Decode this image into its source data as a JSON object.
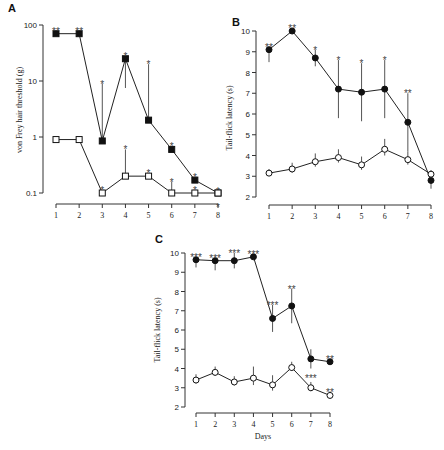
{
  "chart_data": [
    {
      "panel": "A",
      "type": "line",
      "title": "",
      "xlabel": "",
      "ylabel": "von Frey hair threshold (g)",
      "yscale": "log",
      "ylim": [
        0.1,
        100
      ],
      "yticks": [
        "0.1",
        "1",
        "10",
        "100"
      ],
      "x": [
        1,
        2,
        3,
        4,
        5,
        6,
        7,
        8
      ],
      "series": [
        {
          "name": "filled squares",
          "marker": "square-filled",
          "values": [
            70,
            70,
            0.85,
            25,
            2,
            0.6,
            0.17,
            0.1
          ],
          "error_up": [
            null,
            null,
            9,
            null,
            20,
            null,
            null,
            null
          ],
          "error_down": [
            null,
            null,
            null,
            7.5,
            null,
            null,
            null,
            null
          ],
          "sig": [
            "**",
            "**",
            "*",
            "*",
            "*",
            "*",
            "*",
            "*"
          ]
        },
        {
          "name": "open squares",
          "marker": "square-open",
          "values": [
            0.9,
            0.9,
            0.1,
            0.2,
            0.2,
            0.1,
            0.1,
            0.1
          ],
          "error_up": [
            null,
            null,
            null,
            0.6,
            null,
            0.16,
            null,
            null
          ],
          "sig": [
            "",
            "",
            "*",
            "*",
            "*",
            "*",
            "*",
            "*"
          ]
        }
      ],
      "grid": false
    },
    {
      "panel": "B",
      "type": "line",
      "title": "",
      "xlabel": "",
      "ylabel": "Tail-flick latency (s)",
      "ylim": [
        2,
        10
      ],
      "yticks": [
        "2",
        "3",
        "4",
        "5",
        "6",
        "7",
        "8",
        "9",
        "10"
      ],
      "x": [
        1,
        2,
        3,
        4,
        5,
        6,
        7,
        8
      ],
      "series": [
        {
          "name": "filled circles",
          "marker": "circle-filled",
          "values": [
            9.1,
            10.0,
            8.7,
            7.2,
            7.05,
            7.2,
            5.6,
            2.8
          ],
          "err": [
            0.6,
            0.0,
            0.4,
            1.4,
            1.4,
            1.4,
            1.4,
            0.4
          ],
          "sig": [
            "**",
            "**",
            "*",
            "*",
            "*",
            "*",
            "**",
            ""
          ]
        },
        {
          "name": "open circles",
          "marker": "circle-open",
          "values": [
            3.15,
            3.35,
            3.7,
            3.9,
            3.55,
            4.3,
            3.8,
            3.1
          ],
          "err": [
            0.2,
            0.3,
            0.4,
            0.4,
            0.4,
            0.5,
            0.4,
            0.2
          ],
          "sig": [
            "",
            "",
            "",
            "",
            "",
            "",
            "",
            ""
          ]
        }
      ],
      "grid": false
    },
    {
      "panel": "C",
      "type": "line",
      "title": "",
      "xlabel": "Days",
      "ylabel": "Tail-flick latency (s)",
      "ylim": [
        2,
        10
      ],
      "yticks": [
        "2",
        "3",
        "4",
        "5",
        "6",
        "7",
        "8",
        "9",
        "10"
      ],
      "x": [
        1,
        2,
        3,
        4,
        5,
        6,
        7,
        8
      ],
      "series": [
        {
          "name": "filled circles",
          "marker": "circle-filled",
          "values": [
            9.65,
            9.6,
            9.6,
            9.8,
            6.6,
            7.25,
            4.5,
            4.35
          ],
          "err": [
            0.4,
            0.5,
            0.4,
            0.0,
            0.7,
            0.9,
            0.5,
            0.0
          ],
          "sig": [
            "***",
            "***",
            "***",
            "***",
            "***",
            "**",
            "",
            "**"
          ]
        },
        {
          "name": "open circles",
          "marker": "circle-open",
          "values": [
            3.4,
            3.8,
            3.3,
            3.5,
            3.15,
            4.05,
            3.0,
            2.6
          ],
          "err": [
            0.3,
            0.3,
            0.3,
            0.6,
            0.5,
            0.3,
            0.3,
            0.2
          ],
          "sig": [
            "",
            "",
            "",
            "",
            "",
            "",
            "***",
            "**"
          ]
        }
      ],
      "grid": false
    }
  ],
  "labels": {
    "panelA": "A",
    "panelB": "B",
    "panelC": "C",
    "yA": "von Frey hair threshold (g)",
    "yB": "Tail-flick latency (s)",
    "yC": "Tail-flick latency (s)",
    "xC": "Days"
  }
}
